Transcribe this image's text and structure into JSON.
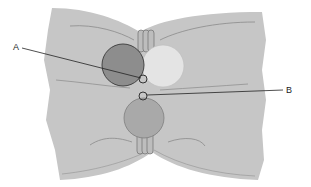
{
  "diagram": {
    "type": "anatomical-illustration",
    "colors": {
      "background": "#ffffff",
      "tissue": "#c6c6c6",
      "tissue_fold": "#8a8a8a",
      "dark_circle": "#8d8d8d",
      "light_circle": "#e4e4e4",
      "lower_circle": "#a9a9a9",
      "outline": "#555555",
      "leader_line": "#222222"
    },
    "labels": [
      {
        "id": "A",
        "text": "A",
        "points_to": "small ring at lower right edge of dark circle"
      },
      {
        "id": "B",
        "text": "B",
        "points_to": "small ring above lower circle"
      }
    ]
  }
}
